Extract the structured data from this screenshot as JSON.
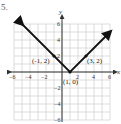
{
  "figure_label": "5.",
  "chart_data": {
    "type": "line",
    "title": "",
    "xlabel": "x",
    "ylabel": "y",
    "xlim": [
      -6,
      6
    ],
    "ylim": [
      -6,
      6
    ],
    "grid": true,
    "x_ticks": [
      "-6",
      "-4",
      "-2",
      "2",
      "4",
      "6"
    ],
    "y_ticks": [
      "6",
      "4",
      "2",
      "-2",
      "-4",
      "-6"
    ],
    "series": [
      {
        "name": "y = |x - 1|",
        "x": [
          -5,
          1,
          6
        ],
        "y": [
          6,
          0,
          5
        ],
        "arrows_at_ends": true
      }
    ],
    "annotations": [
      {
        "label": "(-1, 2)",
        "x": -1,
        "y": 2
      },
      {
        "label": "(1, 0)",
        "x": 1,
        "y": 0
      },
      {
        "label": "(3, 2)",
        "x": 3,
        "y": 2
      }
    ]
  }
}
